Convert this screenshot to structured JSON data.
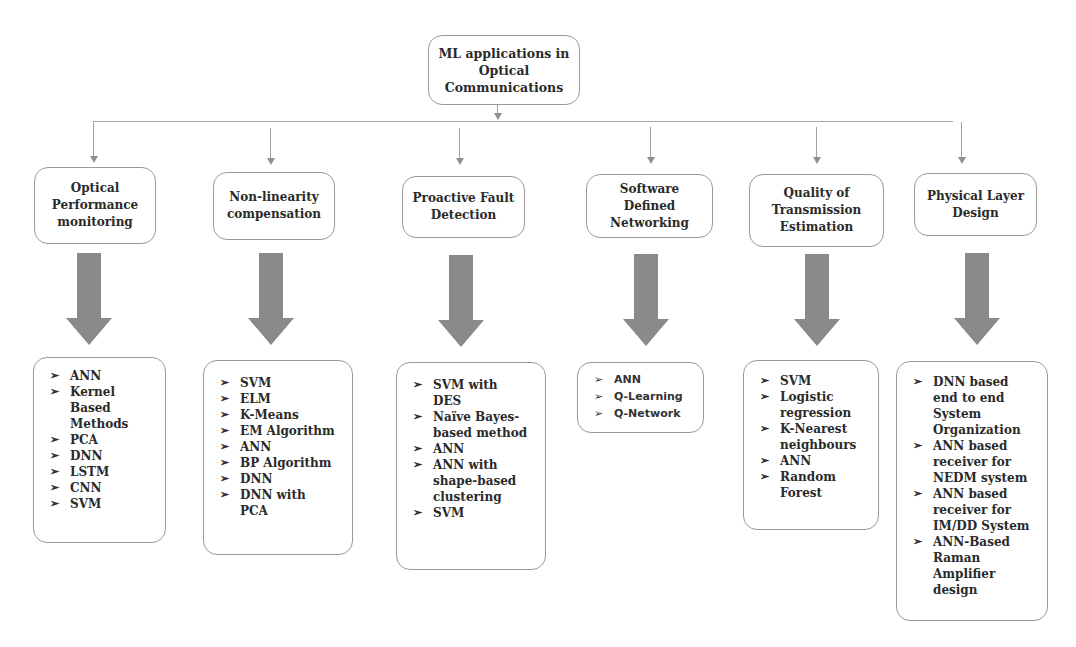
{
  "root": {
    "title": "ML applications in Optical Communications"
  },
  "categories": [
    {
      "title": "Optical Performance monitoring",
      "items": [
        "ANN",
        "Kernel Based Methods",
        "PCA",
        "DNN",
        "LSTM",
        "CNN",
        "SVM"
      ]
    },
    {
      "title": "Non-linearity compensation",
      "items": [
        "SVM",
        "ELM",
        "K-Means",
        "EM Algorithm",
        "ANN",
        "BP Algorithm",
        "DNN",
        "DNN with PCA"
      ]
    },
    {
      "title": "Proactive Fault Detection",
      "items": [
        "SVM with DES",
        "Naïve Bayes-based method",
        "ANN",
        "ANN with shape-based clustering",
        "SVM"
      ]
    },
    {
      "title": "Software Defined Networking",
      "items": [
        "ANN",
        "Q-Learning",
        "Q-Network"
      ]
    },
    {
      "title": "Quality of Transmission Estimation",
      "items": [
        "SVM",
        "Logistic regression",
        "K-Nearest neighbours",
        "ANN",
        "Random Forest"
      ]
    },
    {
      "title": "Physical Layer Design",
      "items": [
        "DNN based end to end System Organization",
        "ANN based receiver for NEDM system",
        "ANN based receiver for IM/DD System",
        "ANN-Based Raman Amplifier design"
      ]
    }
  ],
  "bullet_glyph": "➢",
  "colors": {
    "box_border": "#9a9a9a",
    "connector": "#a0a0a0",
    "big_arrow": "#8a8a8a",
    "text": "#2a2a2a"
  }
}
